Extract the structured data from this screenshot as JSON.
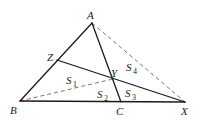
{
  "diagram": {
    "type": "geometry",
    "points": {
      "A": {
        "label": "A",
        "x": 92,
        "y": 23
      },
      "B": {
        "label": "B",
        "x": 20,
        "y": 101
      },
      "C": {
        "label": "C",
        "x": 121,
        "y": 102
      },
      "X": {
        "label": "X",
        "x": 185,
        "y": 102
      },
      "Y": {
        "label": "Y",
        "x": 113,
        "y": 79
      },
      "Z": {
        "label": "Z",
        "x": 57,
        "y": 60
      }
    },
    "solid_segments": [
      [
        "A",
        "B"
      ],
      [
        "B",
        "X"
      ],
      [
        "A",
        "C"
      ],
      [
        "Z",
        "X"
      ]
    ],
    "dashed_segments": [
      [
        "A",
        "X"
      ],
      [
        "B",
        "Y"
      ]
    ],
    "regions": [
      {
        "label": "S",
        "sub": "1"
      },
      {
        "label": "S",
        "sub": "2"
      },
      {
        "label": "S",
        "sub": "3"
      },
      {
        "label": "S",
        "sub": "4"
      }
    ]
  }
}
